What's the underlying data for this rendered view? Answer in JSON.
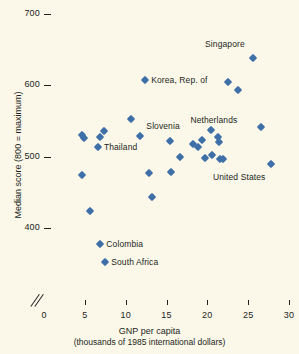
{
  "chart_data": {
    "type": "scatter",
    "title": "",
    "xlabel": "GNP per capita",
    "xlabel_sub": "(thousands of 1985 international dollars)",
    "ylabel": "Median score (800 = maximum)",
    "xlim": [
      0,
      30
    ],
    "ylim": [
      400,
      700
    ],
    "x_ticks": [
      0,
      5,
      10,
      15,
      20,
      25,
      30
    ],
    "y_ticks": [
      400,
      500,
      600,
      700
    ],
    "grid": false,
    "legend": "none",
    "axis_break": "y-axis broken below 400",
    "marker_color": "#3f6fa8",
    "background_color": "#fbf8ea",
    "points": [
      {
        "label": "",
        "x": 4.6,
        "y": 474
      },
      {
        "label": "",
        "x": 4.7,
        "y": 531
      },
      {
        "label": "",
        "x": 4.9,
        "y": 526
      },
      {
        "label": "South Africa",
        "x": 7.5,
        "y": 352
      },
      {
        "label": "Colombia",
        "x": 6.9,
        "y": 377
      },
      {
        "label": "",
        "x": 5.6,
        "y": 424
      },
      {
        "label": "Thailand",
        "x": 6.6,
        "y": 514
      },
      {
        "label": "",
        "x": 6.8,
        "y": 528
      },
      {
        "label": "",
        "x": 7.3,
        "y": 536
      },
      {
        "label": "",
        "x": 10.7,
        "y": 553
      },
      {
        "label": "Korea, Rep. of",
        "x": 12.4,
        "y": 607
      },
      {
        "label": "Slovenia",
        "x": 11.8,
        "y": 529
      },
      {
        "label": "",
        "x": 12.8,
        "y": 477
      },
      {
        "label": "",
        "x": 13.2,
        "y": 444
      },
      {
        "label": "",
        "x": 15.4,
        "y": 522
      },
      {
        "label": "",
        "x": 15.6,
        "y": 479
      },
      {
        "label": "",
        "x": 16.6,
        "y": 500
      },
      {
        "label": "",
        "x": 18.2,
        "y": 518
      },
      {
        "label": "",
        "x": 18.8,
        "y": 513
      },
      {
        "label": "",
        "x": 19.4,
        "y": 524
      },
      {
        "label": "",
        "x": 19.7,
        "y": 498
      },
      {
        "label": "",
        "x": 20.4,
        "y": 537
      },
      {
        "label": "",
        "x": 20.6,
        "y": 503
      },
      {
        "label": "Netherlands",
        "x": 21.3,
        "y": 527
      },
      {
        "label": "",
        "x": 21.4,
        "y": 521
      },
      {
        "label": "",
        "x": 21.5,
        "y": 497
      },
      {
        "label": "",
        "x": 21.9,
        "y": 497
      },
      {
        "label": "",
        "x": 22.5,
        "y": 604
      },
      {
        "label": "",
        "x": 23.8,
        "y": 593
      },
      {
        "label": "Singapore",
        "x": 25.6,
        "y": 639
      },
      {
        "label": "",
        "x": 26.6,
        "y": 542
      },
      {
        "label": "United States",
        "x": 27.8,
        "y": 490
      }
    ],
    "annotations": [
      {
        "name": "singapore-label",
        "text": "Singapore",
        "x": 25.6,
        "y": 639,
        "dx": -8,
        "dy": -14,
        "align": "right"
      },
      {
        "name": "korea-label",
        "text": "Korea, Rep. of",
        "x": 12.4,
        "y": 607,
        "dx": 6,
        "dy": 0,
        "align": "left"
      },
      {
        "name": "netherlands-label",
        "text": "Netherlands",
        "x": 21.3,
        "y": 527,
        "dx": -4,
        "dy": -17,
        "align": "center"
      },
      {
        "name": "slovenia-label",
        "text": "Slovenia",
        "x": 11.8,
        "y": 529,
        "dx": 6,
        "dy": -10,
        "align": "left"
      },
      {
        "name": "thailand-label",
        "text": "Thailand",
        "x": 6.6,
        "y": 514,
        "dx": 6,
        "dy": 0,
        "align": "left"
      },
      {
        "name": "united-states-label",
        "text": "United States",
        "x": 27.8,
        "y": 490,
        "dx": -6,
        "dy": 13,
        "align": "right"
      },
      {
        "name": "colombia-label",
        "text": "Colombia",
        "x": 6.9,
        "y": 377,
        "dx": 6,
        "dy": 0,
        "align": "left"
      },
      {
        "name": "south-africa-label",
        "text": "South Africa",
        "x": 7.5,
        "y": 352,
        "dx": 6,
        "dy": 0,
        "align": "left"
      }
    ]
  },
  "axes": {
    "y_tick_labels": [
      "700",
      "600",
      "500",
      "400"
    ],
    "x_tick_labels": [
      "0",
      "5",
      "10",
      "15",
      "20",
      "25",
      "30"
    ],
    "y_title": "Median score (800 = maximum)",
    "x_title": "GNP per capita",
    "x_subtitle": "(thousands of 1985 international dollars)"
  }
}
